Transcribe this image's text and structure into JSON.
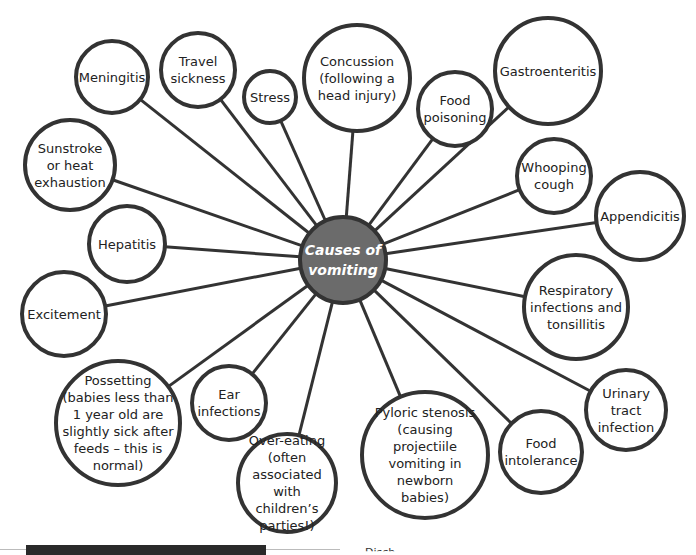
{
  "diagram": {
    "title": "Causes of vomiting",
    "center": {
      "label": "Causes of\nvomiting",
      "fill": "#6b6b6b",
      "cx": 343,
      "cy": 260,
      "r": 45
    },
    "nodes": [
      {
        "id": "meningitis",
        "label": "Meningitis",
        "cx": 112,
        "cy": 77,
        "r": 38
      },
      {
        "id": "travel-sickness",
        "label": "Travel\nsickness",
        "cx": 198,
        "cy": 70,
        "r": 39
      },
      {
        "id": "stress",
        "label": "Stress",
        "cx": 270,
        "cy": 97,
        "r": 28
      },
      {
        "id": "concussion",
        "label": "Concussion\n(following a\nhead injury)",
        "cx": 357,
        "cy": 78,
        "r": 55
      },
      {
        "id": "food-poisoning",
        "label": "Food\npoisoning",
        "cx": 455,
        "cy": 109,
        "r": 39
      },
      {
        "id": "gastroenteritis",
        "label": "Gastroenteritis",
        "cx": 548,
        "cy": 71,
        "r": 55
      },
      {
        "id": "sunstroke",
        "label": "Sunstroke\nor heat\nexhaustion",
        "cx": 70,
        "cy": 165,
        "r": 47
      },
      {
        "id": "whooping-cough",
        "label": "Whooping\ncough",
        "cx": 554,
        "cy": 176,
        "r": 39
      },
      {
        "id": "appendicitis",
        "label": "Appendicitis",
        "cx": 640,
        "cy": 216,
        "r": 46
      },
      {
        "id": "hepatitis",
        "label": "Hepatitis",
        "cx": 127,
        "cy": 244,
        "r": 40
      },
      {
        "id": "respiratory",
        "label": "Respiratory\ninfections and\ntonsillitis",
        "cx": 576,
        "cy": 307,
        "r": 54
      },
      {
        "id": "excitement",
        "label": "Excitement",
        "cx": 64,
        "cy": 314,
        "r": 44
      },
      {
        "id": "possetting",
        "label": "Possetting\n(babies less than\n1 year old are\nslightly sick after\nfeeds – this is\nnormal)",
        "cx": 118,
        "cy": 423,
        "r": 64
      },
      {
        "id": "ear-infections",
        "label": "Ear\ninfections",
        "cx": 229,
        "cy": 403,
        "r": 39
      },
      {
        "id": "urinary",
        "label": "Urinary\ntract\ninfection",
        "cx": 626,
        "cy": 410,
        "r": 42
      },
      {
        "id": "food-intolerance",
        "label": "Food\nintolerance",
        "cx": 541,
        "cy": 452,
        "r": 43
      },
      {
        "id": "pyloric-stenosis",
        "label": "Pyloric stenosis\n(causing projectiile\nvomiting in\nnewborn\nbabies)",
        "cx": 425,
        "cy": 455,
        "r": 65
      },
      {
        "id": "over-eating",
        "label": "Over-eating\n(often\nassociated\nwith children’s\nparties!)",
        "cx": 287,
        "cy": 483,
        "r": 51
      }
    ]
  },
  "footer": {
    "partial_text": "Disch"
  },
  "colors": {
    "stroke": "#333333",
    "center_fill": "#6b6b6b",
    "text": "#222222"
  }
}
